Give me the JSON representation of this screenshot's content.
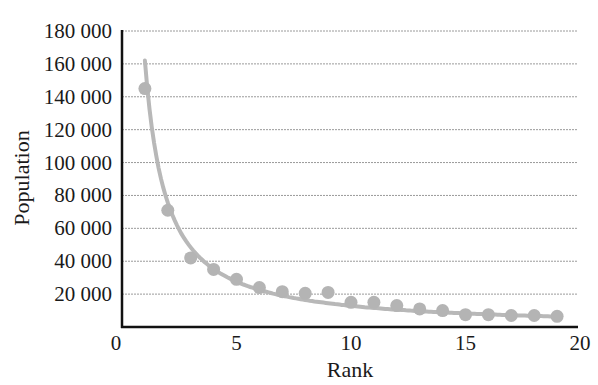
{
  "chart_data": {
    "type": "scatter",
    "title": "",
    "xlabel": "Rank",
    "ylabel": "Population",
    "xlim": [
      0,
      20
    ],
    "ylim": [
      0,
      180000
    ],
    "x_ticks": [
      0,
      5,
      10,
      15,
      20
    ],
    "x_tick_labels": [
      "0",
      "5",
      "10",
      "15",
      "20"
    ],
    "y_ticks": [
      20000,
      40000,
      60000,
      80000,
      100000,
      120000,
      140000,
      160000,
      180000
    ],
    "y_tick_labels": [
      "20 000",
      "40 000",
      "60 000",
      "80 000",
      "100 000",
      "120 000",
      "140 000",
      "160 000",
      "180 000"
    ],
    "y_zero_label": "0",
    "grid": "horizontal dashed",
    "legend": null,
    "series": [
      {
        "name": "Observed population",
        "kind": "points",
        "x": [
          1,
          2,
          3,
          4,
          5,
          6,
          7,
          8,
          9,
          10,
          11,
          12,
          13,
          14,
          15,
          16,
          17,
          18,
          19
        ],
        "values": [
          145000,
          71000,
          42000,
          35000,
          29000,
          24000,
          21500,
          20500,
          21000,
          15000,
          15000,
          13000,
          11000,
          10000,
          7500,
          7500,
          7000,
          7000,
          6500
        ]
      },
      {
        "name": "Fitted curve (approx. 160000 / rank)",
        "kind": "line",
        "x_range": [
          1,
          19
        ],
        "formula": "y = 162000 / x^1.1"
      }
    ],
    "colors": {
      "points": "#b4b4b4",
      "curve": "#b8b8b8",
      "axis": "#111111",
      "grid": "#9a9a9a"
    }
  }
}
